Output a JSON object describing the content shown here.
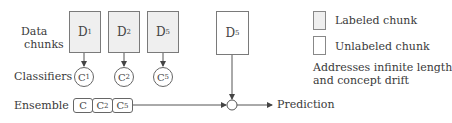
{
  "row_labels": {
    "data_chunks_line1": "Data",
    "data_chunks_line2": "chunks",
    "classifiers": "Classifiers",
    "ensemble": "Ensemble"
  },
  "chunks": [
    {
      "base": "D",
      "sub": "1",
      "type": "labeled"
    },
    {
      "base": "D",
      "sub": "2",
      "type": "labeled"
    },
    {
      "base": "D",
      "sub": "5",
      "type": "labeled"
    },
    {
      "base": "D",
      "sub": "5",
      "type": "unlabeled"
    }
  ],
  "classifiers": [
    {
      "base": "C",
      "sub": "1"
    },
    {
      "base": "C",
      "sub": "2"
    },
    {
      "base": "C",
      "sub": "5"
    }
  ],
  "ensemble": [
    {
      "base": "C",
      "sub": ""
    },
    {
      "base": "C",
      "sub": "2"
    },
    {
      "base": "C",
      "sub": "5"
    }
  ],
  "output_label": "Prediction",
  "legend": {
    "labeled": "Labeled chunk",
    "unlabeled": "Unlabeled chunk",
    "note_line1": "Addresses infinite length",
    "note_line2": "and concept drift"
  },
  "colors": {
    "labeled_fill": "#efefef",
    "unlabeled_fill": "#ffffff",
    "stroke": "#666666"
  }
}
